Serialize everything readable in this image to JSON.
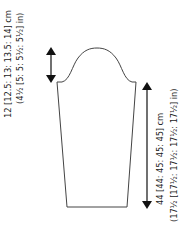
{
  "diagram": {
    "type": "sleeve-schematic",
    "colors": {
      "line": "#444444",
      "arrow": "#111111",
      "text": "#1a1a1a"
    },
    "cap_depth": {
      "cm_label": "12 [12.5: 13: 13.5: 14] cm",
      "in_label": "(4½ [5: 5: 5½: 5½] in)"
    },
    "sleeve_length": {
      "cm_label": "44 [44: 45: 45: 45] cm",
      "in_label": "(17½ [17½: 17½: 17½: 17½] in)"
    }
  }
}
